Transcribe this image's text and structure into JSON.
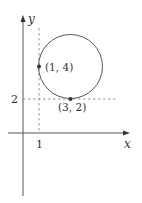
{
  "diagram": {
    "type": "coordinate-plane-circle",
    "axes": {
      "x_label": "x",
      "y_label": "y"
    },
    "ticks": {
      "x_tick_label": "1",
      "y_tick_label": "2"
    },
    "points": [
      {
        "label": "(1, 4)",
        "x": 1,
        "y": 4
      },
      {
        "label": "(3, 2)",
        "x": 3,
        "y": 2
      }
    ],
    "circle": {
      "center_x": 3,
      "center_y": 4,
      "radius": 2
    },
    "guides": {
      "vertical_dashed_at_x": 1,
      "horizontal_dashed_at_y": 2
    },
    "colors": {
      "stroke": "#555555",
      "dash": "#888888",
      "text": "#333333"
    }
  }
}
